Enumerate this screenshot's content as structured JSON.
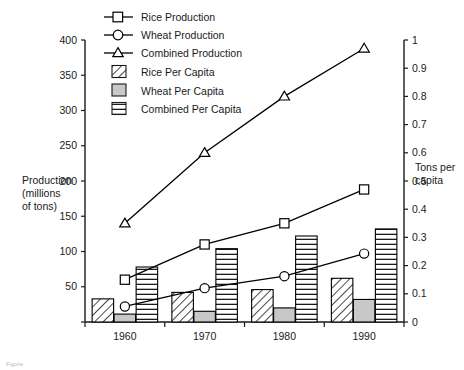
{
  "chart_data": {
    "type": "bar",
    "title": "",
    "subtitle": "",
    "categories": [
      "1960",
      "1970",
      "1980",
      "1990"
    ],
    "xlabel": "",
    "ylabel": "Production (millions of tons)",
    "y2label": "Tons per capita",
    "ylim": [
      0,
      400
    ],
    "y2lim": [
      0,
      1
    ],
    "yticks": [
      "0",
      "50",
      "100",
      "150",
      "200",
      "250",
      "300",
      "350",
      "400"
    ],
    "ytickvals": [
      0,
      50,
      100,
      150,
      200,
      250,
      300,
      350,
      400
    ],
    "y2ticks": [
      "0",
      "0.1",
      "0.2",
      "0.3",
      "0.4",
      "0.5",
      "0.6",
      "0.7",
      "0.8",
      "0.9",
      "1"
    ],
    "y2tickvals": [
      0,
      0.1,
      0.2,
      0.3,
      0.4,
      0.5,
      0.6,
      0.7,
      0.8,
      0.9,
      1
    ],
    "grid": false,
    "legend_position": "top-center",
    "series": [
      {
        "name": "Rice Production",
        "kind": "line",
        "marker": "square",
        "axis": "left",
        "values": [
          60,
          110,
          140,
          188
        ]
      },
      {
        "name": "Wheat Production",
        "kind": "line",
        "marker": "circle",
        "axis": "left",
        "values": [
          22,
          48,
          65,
          97
        ]
      },
      {
        "name": "Combined Production",
        "kind": "line",
        "marker": "triangle",
        "axis": "left",
        "values": [
          140,
          240,
          320,
          388
        ]
      },
      {
        "name": "Rice Per Capita",
        "kind": "bar",
        "fill": "diagonal-hatch",
        "axis": "right",
        "values": [
          0.082,
          0.105,
          0.115,
          0.155
        ]
      },
      {
        "name": "Wheat Per Capita",
        "kind": "bar",
        "fill": "solid-gray",
        "axis": "right",
        "values": [
          0.028,
          0.038,
          0.05,
          0.08
        ]
      },
      {
        "name": "Combined Per Capita",
        "kind": "bar",
        "fill": "horizontal-stripe",
        "axis": "right",
        "values": [
          0.195,
          0.26,
          0.305,
          0.33
        ]
      }
    ]
  },
  "axes": {
    "left_title_line1": "Production",
    "left_title_line2": "(millions",
    "left_title_line3": "of tons)",
    "right_title_line1": "Tons per",
    "right_title_line2": "capita"
  },
  "legend": {
    "items": [
      {
        "label": "Rice Production",
        "icon": "line-square-marker-icon"
      },
      {
        "label": "Wheat Production",
        "icon": "line-circle-marker-icon"
      },
      {
        "label": "Combined Production",
        "icon": "line-triangle-marker-icon"
      },
      {
        "label": "Rice Per Capita",
        "icon": "swatch-diagonal-hatch-icon"
      },
      {
        "label": "Wheat Per Capita",
        "icon": "swatch-solid-gray-icon"
      },
      {
        "label": "Combined Per Capita",
        "icon": "swatch-horizontal-stripe-icon"
      }
    ]
  },
  "colors": {
    "ink": "#1a1a1a",
    "line": "#000000",
    "marker_fill": "#ffffff",
    "gray_fill": "#c8c8c8",
    "background": "#ffffff"
  }
}
